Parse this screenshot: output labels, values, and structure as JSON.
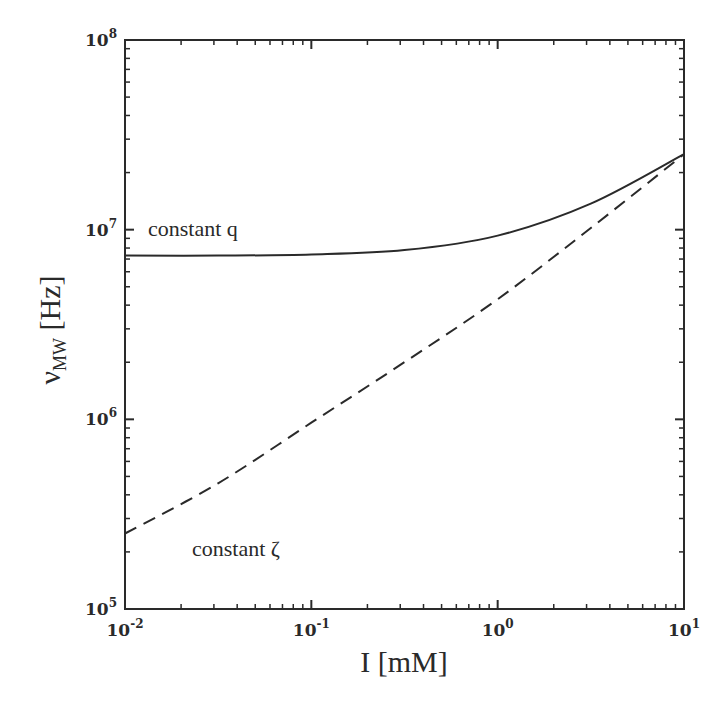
{
  "chart_data": {
    "type": "line",
    "title": "",
    "xlabel": "I [mM]",
    "ylabel": "ν_MW [Hz]",
    "ylabel_main": "ν",
    "ylabel_sub": "MW",
    "ylabel_unit": " [Hz]",
    "xscale": "log",
    "yscale": "log",
    "xlim": [
      0.01,
      10
    ],
    "ylim": [
      100000,
      100000000
    ],
    "grid": false,
    "legend": "none (inline annotations)",
    "x_ticks": [
      {
        "base": "10",
        "exp": "-2",
        "value": 0.01
      },
      {
        "base": "10",
        "exp": "-1",
        "value": 0.1
      },
      {
        "base": "10",
        "exp": "0",
        "value": 1
      },
      {
        "base": "10",
        "exp": "1",
        "value": 10
      }
    ],
    "y_ticks": [
      {
        "base": "10",
        "exp": "5",
        "value": 100000
      },
      {
        "base": "10",
        "exp": "6",
        "value": 1000000
      },
      {
        "base": "10",
        "exp": "7",
        "value": 10000000
      },
      {
        "base": "10",
        "exp": "8",
        "value": 100000000
      }
    ],
    "x": [
      0.01,
      0.0316,
      0.1,
      0.316,
      1,
      3.16,
      10
    ],
    "series": [
      {
        "name": "constant q",
        "style": "solid",
        "values": [
          7300000.0,
          7300000.0,
          7400000.0,
          7800000.0,
          9300000.0,
          13700000.0,
          25000000.0
        ]
      },
      {
        "name": "constant ζ",
        "style": "dashed",
        "values": [
          250000.0,
          460000.0,
          960000.0,
          2000000.0,
          4300000.0,
          10200000.0,
          25000000.0
        ]
      }
    ],
    "annotations": [
      {
        "text": "constant q",
        "series": "constant q"
      },
      {
        "text": "constant ζ",
        "series": "constant ζ"
      }
    ]
  },
  "colors": {
    "line": "#2a2a2a",
    "axis": "#2a2a2a",
    "background": "#ffffff"
  }
}
